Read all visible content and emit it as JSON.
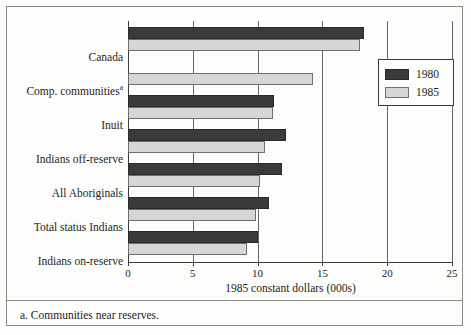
{
  "figure": {
    "footnote": "a. Communities near reserves.",
    "footnote_marker": "a"
  },
  "legend": {
    "entries": [
      {
        "label": "1980",
        "color": "#3a3a3a"
      },
      {
        "label": "1985",
        "color": "#d6d6d4"
      }
    ]
  },
  "chart_data": {
    "type": "bar",
    "orientation": "horizontal",
    "title": "",
    "xlabel": "1985 constant dollars (000s)",
    "ylabel": "",
    "xlim": [
      0,
      25
    ],
    "xticks": [
      0,
      5,
      10,
      15,
      20,
      25
    ],
    "xtick_labels": [
      "0",
      "5",
      "10",
      "15",
      "20",
      "25"
    ],
    "grid": true,
    "grid_axis": "x",
    "legend_position": "upper right",
    "categories": [
      "Canada",
      "Comp. communities",
      "Inuit",
      "Indians off-reserve",
      "All Aboriginals",
      "Total status Indians",
      "Indians on-reserve"
    ],
    "category_labels": [
      "Canada",
      "Comp. communities<sup>a</sup>",
      "Inuit",
      "Indians off-reserve",
      "All Aboriginals",
      "Total status Indians",
      "Indians on-reserve"
    ],
    "series": [
      {
        "name": "1980",
        "color": "#3a3a3a",
        "values": [
          18.2,
          null,
          11.3,
          12.2,
          11.9,
          10.9,
          10.0
        ]
      },
      {
        "name": "1985",
        "color": "#d6d6d4",
        "values": [
          17.9,
          14.3,
          11.2,
          10.6,
          10.2,
          9.9,
          9.2
        ]
      }
    ]
  }
}
